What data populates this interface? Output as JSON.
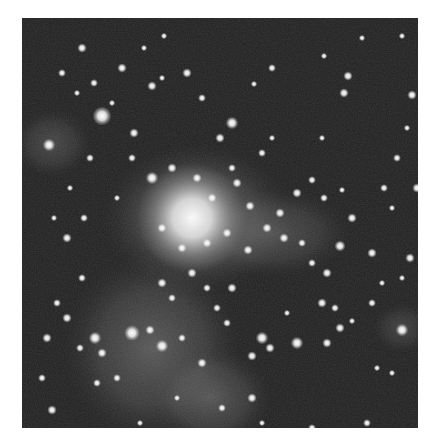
{
  "image": {
    "subject": "star cluster with surrounding nebulosity",
    "mode": "grayscale",
    "background_color": "#1e1e1e",
    "nebula_color": "#8a8a8a",
    "core_color": "#ffffff",
    "frame": {
      "x": 22,
      "y": 18,
      "width": 396,
      "height": 410
    }
  },
  "nebula_regions": [
    {
      "cx": 175,
      "cy": 200,
      "rx": 95,
      "ry": 75,
      "opacity": 0.55
    },
    {
      "cx": 130,
      "cy": 330,
      "rx": 90,
      "ry": 95,
      "opacity": 0.45
    },
    {
      "cx": 190,
      "cy": 380,
      "rx": 60,
      "ry": 50,
      "opacity": 0.4
    },
    {
      "cx": 250,
      "cy": 215,
      "rx": 80,
      "ry": 45,
      "opacity": 0.35
    },
    {
      "cx": 30,
      "cy": 125,
      "rx": 40,
      "ry": 35,
      "opacity": 0.3
    },
    {
      "cx": 380,
      "cy": 310,
      "rx": 30,
      "ry": 25,
      "opacity": 0.25
    }
  ],
  "cluster_core": {
    "cx": 170,
    "cy": 200,
    "r": 55
  },
  "stars": [
    [
      80,
      98,
      6
    ],
    [
      27,
      127,
      4
    ],
    [
      112,
      115,
      3
    ],
    [
      60,
      30,
      3
    ],
    [
      40,
      55,
      2.5
    ],
    [
      100,
      50,
      3
    ],
    [
      122,
      30,
      2
    ],
    [
      142,
      18,
      2
    ],
    [
      55,
      75,
      2
    ],
    [
      72,
      65,
      2.5
    ],
    [
      90,
      85,
      2
    ],
    [
      130,
      68,
      3
    ],
    [
      140,
      60,
      2
    ],
    [
      165,
      55,
      3
    ],
    [
      180,
      80,
      2.5
    ],
    [
      210,
      105,
      4
    ],
    [
      198,
      120,
      3
    ],
    [
      240,
      135,
      2.5
    ],
    [
      250,
      120,
      2
    ],
    [
      300,
      120,
      2
    ],
    [
      326,
      58,
      3
    ],
    [
      340,
      20,
      2
    ],
    [
      380,
      18,
      2
    ],
    [
      390,
      77,
      3
    ],
    [
      322,
      75,
      3
    ],
    [
      302,
      38,
      2
    ],
    [
      250,
      50,
      2.5
    ],
    [
      232,
      66,
      2
    ],
    [
      385,
      110,
      2
    ],
    [
      395,
      170,
      3
    ],
    [
      362,
      170,
      2.5
    ],
    [
      370,
      190,
      2
    ],
    [
      350,
      235,
      3
    ],
    [
      318,
      228,
      3.5
    ],
    [
      305,
      255,
      3
    ],
    [
      290,
      245,
      2.5
    ],
    [
      280,
      225,
      2.5
    ],
    [
      262,
      220,
      3
    ],
    [
      245,
      210,
      3
    ],
    [
      226,
      232,
      3
    ],
    [
      205,
      215,
      3
    ],
    [
      185,
      225,
      3
    ],
    [
      160,
      230,
      3
    ],
    [
      140,
      210,
      3
    ],
    [
      130,
      160,
      4
    ],
    [
      150,
      150,
      3
    ],
    [
      175,
      160,
      3
    ],
    [
      190,
      180,
      3
    ],
    [
      215,
      165,
      3
    ],
    [
      210,
      150,
      2.5
    ],
    [
      228,
      188,
      3
    ],
    [
      258,
      195,
      3
    ],
    [
      275,
      175,
      3
    ],
    [
      290,
      162,
      2.5
    ],
    [
      302,
      180,
      2.5
    ],
    [
      320,
      172,
      2
    ],
    [
      330,
      200,
      3
    ],
    [
      140,
      265,
      3
    ],
    [
      170,
      255,
      3
    ],
    [
      185,
      270,
      2.5
    ],
    [
      210,
      270,
      3
    ],
    [
      195,
      290,
      2.5
    ],
    [
      160,
      320,
      2.5
    ],
    [
      140,
      328,
      4
    ],
    [
      110,
      315,
      5
    ],
    [
      128,
      312,
      3
    ],
    [
      80,
      335,
      3
    ],
    [
      73,
      320,
      4
    ],
    [
      58,
      330,
      2.5
    ],
    [
      45,
      300,
      3
    ],
    [
      35,
      285,
      2.5
    ],
    [
      25,
      320,
      3
    ],
    [
      20,
      360,
      2.5
    ],
    [
      30,
      392,
      3
    ],
    [
      75,
      365,
      2.5
    ],
    [
      95,
      360,
      2.5
    ],
    [
      150,
      280,
      2.5
    ],
    [
      230,
      338,
      3
    ],
    [
      240,
      320,
      4
    ],
    [
      248,
      330,
      3
    ],
    [
      275,
      325,
      4
    ],
    [
      305,
      325,
      3
    ],
    [
      318,
      310,
      3
    ],
    [
      300,
      285,
      3
    ],
    [
      313,
      290,
      2.5
    ],
    [
      330,
      303,
      2
    ],
    [
      380,
      312,
      4
    ],
    [
      350,
      285,
      2.5
    ],
    [
      370,
      355,
      2
    ],
    [
      290,
      410,
      2.5
    ],
    [
      230,
      380,
      3
    ],
    [
      200,
      390,
      2.5
    ],
    [
      240,
      405,
      2
    ],
    [
      345,
      405,
      2.5
    ],
    [
      265,
      295,
      2
    ],
    [
      205,
      305,
      2.5
    ],
    [
      180,
      345,
      3
    ],
    [
      155,
      380,
      2
    ],
    [
      118,
      405,
      2
    ],
    [
      60,
      260,
      2.5
    ],
    [
      45,
      220,
      3
    ],
    [
      62,
      200,
      2.5
    ],
    [
      32,
      200,
      2
    ],
    [
      48,
      170,
      2
    ],
    [
      68,
      140,
      2.5
    ],
    [
      110,
      140,
      2.5
    ],
    [
      95,
      180,
      2
    ],
    [
      375,
      140,
      2.5
    ],
    [
      388,
      240,
      3
    ],
    [
      380,
      260,
      2
    ],
    [
      360,
      265,
      2
    ],
    [
      355,
      350,
      2
    ]
  ]
}
